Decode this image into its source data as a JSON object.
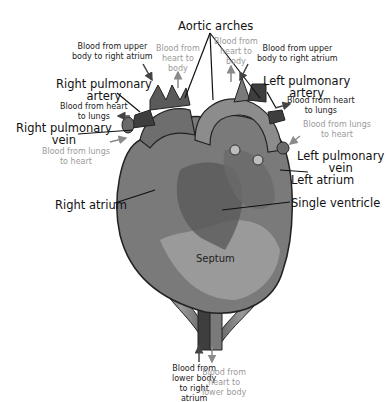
{
  "diagram": {
    "title_label": "Aortic arches",
    "colors": {
      "heart_body": "#7a7a7a",
      "heart_light": "#a8a8a8",
      "heart_dark": "#555555",
      "vessel_dark": "#3e3e3e",
      "label_black": "#111111",
      "label_gray": "#9a9a9a",
      "background": "#ffffff"
    },
    "structure_labels": {
      "aortic_arches": "Aortic arches",
      "right_pulmonary_artery": "Right pulmonary artery",
      "left_pulmonary_artery": "Left pulmonary artery",
      "right_pulmonary_vein": "Right pulmonary vein",
      "left_pulmonary_vein": "Left pulmonary vein",
      "right_atrium": "Right atrium",
      "left_atrium": "Left atrium",
      "single_ventricle": "Single ventricle",
      "septum": "Septum"
    },
    "flow_labels": {
      "upper_body_left": [
        "Blood from upper",
        "body to right atrium"
      ],
      "upper_body_right": [
        "Blood from upper",
        "body to right atrium"
      ],
      "heart_to_body_left": [
        "Blood from",
        "heart to",
        "body"
      ],
      "heart_to_body_right": [
        "Blood from",
        "heart to",
        "body"
      ],
      "heart_to_lungs_left": [
        "Blood from heart",
        "to lungs"
      ],
      "heart_to_lungs_right": [
        "Blood from heart",
        "to lungs"
      ],
      "lungs_to_heart_left": [
        "Blood from lungs",
        "to heart"
      ],
      "lungs_to_heart_right": [
        "Blood from lungs",
        "to heart"
      ],
      "lower_body": [
        "Blood from",
        "lower body",
        "to right",
        "atrium"
      ],
      "heart_to_lower_body": [
        "Blood from",
        "heart to",
        "lower body"
      ]
    },
    "structure_label_parts": {
      "right_pulmonary_artery": [
        "Right pulmonary",
        "artery"
      ],
      "left_pulmonary_artery": [
        "Left pulmonary",
        "artery"
      ],
      "right_pulmonary_vein": [
        "Right pulmonary",
        "vein"
      ],
      "left_pulmonary_vein": [
        "Left pulmonary",
        "vein"
      ]
    }
  }
}
